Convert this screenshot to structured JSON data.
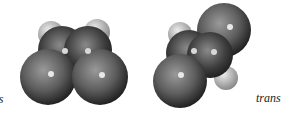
{
  "figure": {
    "molecules": [
      {
        "name": "cis",
        "label": "cis"
      },
      {
        "name": "trans",
        "label": "trans"
      }
    ],
    "colors": {
      "hydrogen": "#c8c8c8",
      "carbon": "#444444",
      "chlorine": "#7a7a7a"
    }
  }
}
